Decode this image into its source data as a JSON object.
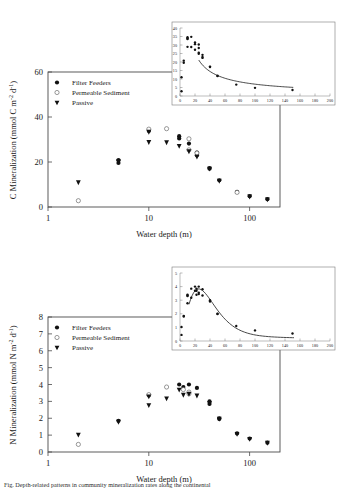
{
  "figure": {
    "caption_partial": "Fig. Depth-related patterns in community mineralization rates along the continental",
    "panels": [
      "top",
      "bottom"
    ]
  },
  "legend": {
    "items": [
      {
        "label": "Filter Feeders",
        "marker": "filled-circle"
      },
      {
        "label": "Permeable Sediment",
        "marker": "open-circle"
      },
      {
        "label": "Passive",
        "marker": "filled-triangle-down"
      }
    ]
  },
  "chart_data": [
    {
      "id": "c-mineralization-main",
      "type": "scatter",
      "title": "",
      "xlabel": "Water depth (m)",
      "ylabel": "C Mineralization (mmol C m-2 d-1)",
      "ylabel_display": "C Mineralization (mmol C m",
      "ylabel_sup1": "-2",
      "ylabel_mid": " d",
      "ylabel_sup2": "-1",
      "ylabel_end": ")",
      "xscale": "log",
      "xlim": [
        1,
        200
      ],
      "ylim": [
        0,
        60
      ],
      "xticks": [
        1,
        10,
        100
      ],
      "xtick_labels": [
        "1",
        "10",
        "100"
      ],
      "yticks": [
        0,
        20,
        40,
        60
      ],
      "ytick_labels": [
        "0",
        "20",
        "40",
        "60"
      ],
      "grid": false,
      "legend_position": "upper-left",
      "series": [
        {
          "name": "Filter Feeders",
          "marker": "filled-circle",
          "points": [
            {
              "x": 5,
              "y": 20.8
            },
            {
              "x": 5,
              "y": 19.6
            },
            {
              "x": 10,
              "y": 33.8
            },
            {
              "x": 20,
              "y": 31.5
            },
            {
              "x": 20,
              "y": 30.5
            },
            {
              "x": 25,
              "y": 28.2
            },
            {
              "x": 30,
              "y": 24.2
            },
            {
              "x": 30,
              "y": 23.0
            },
            {
              "x": 40,
              "y": 17.3
            },
            {
              "x": 40,
              "y": 17.0
            },
            {
              "x": 50,
              "y": 11.9
            },
            {
              "x": 75,
              "y": 6.7
            },
            {
              "x": 100,
              "y": 4.8
            },
            {
              "x": 150,
              "y": 3.5
            }
          ]
        },
        {
          "name": "Permeable Sediment",
          "marker": "open-circle",
          "points": [
            {
              "x": 2,
              "y": 2.8
            },
            {
              "x": 10,
              "y": 34.6
            },
            {
              "x": 15,
              "y": 34.8
            },
            {
              "x": 25,
              "y": 30.3
            },
            {
              "x": 25,
              "y": 25.4
            },
            {
              "x": 30,
              "y": 24.0
            },
            {
              "x": 75,
              "y": 6.5
            }
          ]
        },
        {
          "name": "Passive",
          "marker": "filled-triangle-down",
          "points": [
            {
              "x": 2,
              "y": 11.0
            },
            {
              "x": 5,
              "y": 20.4
            },
            {
              "x": 10,
              "y": 33.5
            },
            {
              "x": 10,
              "y": 28.9
            },
            {
              "x": 15,
              "y": 28.8
            },
            {
              "x": 20,
              "y": 27.2
            },
            {
              "x": 25,
              "y": 24.8
            },
            {
              "x": 30,
              "y": 22.4
            },
            {
              "x": 40,
              "y": 17.1
            },
            {
              "x": 50,
              "y": 11.7
            },
            {
              "x": 100,
              "y": 4.7
            },
            {
              "x": 150,
              "y": 3.4
            }
          ]
        }
      ]
    },
    {
      "id": "c-mineralization-inset",
      "type": "scatter",
      "xlabel": "",
      "ylabel": "",
      "xscale": "linear",
      "xlim": [
        0,
        200
      ],
      "ylim": [
        0,
        40
      ],
      "xticks": [
        0,
        20,
        40,
        60,
        80,
        100,
        120,
        140,
        160,
        180,
        200
      ],
      "xtick_labels": [
        "0",
        "20",
        "40",
        "60",
        "80",
        "100",
        "120",
        "140",
        "160",
        "180",
        "200"
      ],
      "yticks": [
        0,
        5,
        10,
        15,
        20,
        25,
        30,
        35,
        40
      ],
      "ytick_labels": [
        "0",
        "5",
        "10",
        "15",
        "20",
        "25",
        "30",
        "35",
        "40"
      ],
      "grid": false,
      "has_fit_curve": true,
      "fit_curve_note": "decaying power/exponential fit from ~22 at x=25 to ~3 at x=150",
      "series": [
        {
          "name": "All data",
          "marker": "filled-circle",
          "points": [
            {
              "x": 2,
              "y": 11.0
            },
            {
              "x": 2,
              "y": 2.8
            },
            {
              "x": 5,
              "y": 20.8
            },
            {
              "x": 5,
              "y": 19.6
            },
            {
              "x": 10,
              "y": 34.6
            },
            {
              "x": 10,
              "y": 33.8
            },
            {
              "x": 10,
              "y": 33.5
            },
            {
              "x": 10,
              "y": 28.9
            },
            {
              "x": 15,
              "y": 34.8
            },
            {
              "x": 15,
              "y": 28.8
            },
            {
              "x": 20,
              "y": 31.5
            },
            {
              "x": 20,
              "y": 30.5
            },
            {
              "x": 20,
              "y": 27.2
            },
            {
              "x": 25,
              "y": 30.3
            },
            {
              "x": 25,
              "y": 28.2
            },
            {
              "x": 25,
              "y": 25.4
            },
            {
              "x": 25,
              "y": 24.8
            },
            {
              "x": 30,
              "y": 24.2
            },
            {
              "x": 30,
              "y": 23.0
            },
            {
              "x": 30,
              "y": 22.4
            },
            {
              "x": 40,
              "y": 17.3
            },
            {
              "x": 40,
              "y": 17.1
            },
            {
              "x": 50,
              "y": 11.9
            },
            {
              "x": 50,
              "y": 11.7
            },
            {
              "x": 75,
              "y": 6.7
            },
            {
              "x": 100,
              "y": 4.8
            },
            {
              "x": 150,
              "y": 3.5
            }
          ]
        }
      ]
    },
    {
      "id": "n-mineralization-main",
      "type": "scatter",
      "title": "",
      "xlabel": "Water depth (m)",
      "ylabel": "N Mineralization (mmol N m-2 d-1)",
      "ylabel_display": "N Mineralization (mmol N m",
      "ylabel_sup1": "-2",
      "ylabel_mid": " d",
      "ylabel_sup2": "-1",
      "ylabel_end": ")",
      "xscale": "log",
      "xlim": [
        1,
        200
      ],
      "ylim": [
        0,
        8
      ],
      "xticks": [
        1,
        10,
        100
      ],
      "xtick_labels": [
        "1",
        "10",
        "100"
      ],
      "yticks": [
        0,
        1,
        2,
        3,
        4,
        5,
        6,
        7,
        8
      ],
      "ytick_labels": [
        "0",
        "1",
        "2",
        "3",
        "4",
        "5",
        "6",
        "7",
        "8"
      ],
      "grid": false,
      "legend_position": "upper-left",
      "series": [
        {
          "name": "Filter Feeders",
          "marker": "filled-circle",
          "points": [
            {
              "x": 5,
              "y": 1.85
            },
            {
              "x": 10,
              "y": 3.35
            },
            {
              "x": 20,
              "y": 4.0
            },
            {
              "x": 22,
              "y": 3.85
            },
            {
              "x": 25,
              "y": 4.0
            },
            {
              "x": 30,
              "y": 3.8
            },
            {
              "x": 40,
              "y": 3.0
            },
            {
              "x": 40,
              "y": 2.85
            },
            {
              "x": 50,
              "y": 2.0
            },
            {
              "x": 50,
              "y": 1.95
            },
            {
              "x": 75,
              "y": 1.1
            },
            {
              "x": 100,
              "y": 0.8
            },
            {
              "x": 150,
              "y": 0.55
            }
          ]
        },
        {
          "name": "Permeable Sediment",
          "marker": "open-circle",
          "points": [
            {
              "x": 2,
              "y": 0.45
            },
            {
              "x": 10,
              "y": 3.4
            },
            {
              "x": 15,
              "y": 3.85
            },
            {
              "x": 22,
              "y": 3.7
            },
            {
              "x": 25,
              "y": 3.55
            },
            {
              "x": 25,
              "y": 3.45
            }
          ]
        },
        {
          "name": "Passive",
          "marker": "filled-triangle-down",
          "points": [
            {
              "x": 2,
              "y": 1.03
            },
            {
              "x": 5,
              "y": 1.8
            },
            {
              "x": 10,
              "y": 3.3
            },
            {
              "x": 10,
              "y": 2.78
            },
            {
              "x": 15,
              "y": 3.18
            },
            {
              "x": 20,
              "y": 3.7
            },
            {
              "x": 22,
              "y": 3.4
            },
            {
              "x": 25,
              "y": 3.45
            },
            {
              "x": 30,
              "y": 3.35
            },
            {
              "x": 40,
              "y": 2.9
            },
            {
              "x": 50,
              "y": 1.98
            },
            {
              "x": 75,
              "y": 1.08
            },
            {
              "x": 100,
              "y": 0.78
            },
            {
              "x": 150,
              "y": 0.55
            }
          ]
        }
      ]
    },
    {
      "id": "n-mineralization-inset",
      "type": "scatter",
      "xlabel": "",
      "ylabel": "",
      "xscale": "linear",
      "xlim": [
        0,
        200
      ],
      "ylim": [
        0,
        5
      ],
      "xticks": [
        0,
        20,
        40,
        60,
        80,
        100,
        120,
        140,
        160,
        180,
        200
      ],
      "xtick_labels": [
        "0",
        "20",
        "40",
        "60",
        "80",
        "100",
        "120",
        "140",
        "160",
        "180",
        "200"
      ],
      "yticks": [
        0,
        1,
        2,
        3,
        4,
        5
      ],
      "ytick_labels": [
        "0",
        "1",
        "2",
        "3",
        "4",
        "5"
      ],
      "grid": false,
      "has_fit_curve": true,
      "fit_curve_note": "rise then decay fit peaking ~3.4 near x=25 declining to ~0.55 at x=150",
      "series": [
        {
          "name": "All data",
          "marker": "filled-circle",
          "points": [
            {
              "x": 2,
              "y": 1.03
            },
            {
              "x": 2,
              "y": 0.45
            },
            {
              "x": 5,
              "y": 1.85
            },
            {
              "x": 5,
              "y": 1.8
            },
            {
              "x": 10,
              "y": 3.4
            },
            {
              "x": 10,
              "y": 3.35
            },
            {
              "x": 10,
              "y": 3.3
            },
            {
              "x": 10,
              "y": 2.78
            },
            {
              "x": 15,
              "y": 3.85
            },
            {
              "x": 15,
              "y": 3.18
            },
            {
              "x": 20,
              "y": 4.0
            },
            {
              "x": 20,
              "y": 3.7
            },
            {
              "x": 22,
              "y": 3.85
            },
            {
              "x": 22,
              "y": 3.7
            },
            {
              "x": 22,
              "y": 3.4
            },
            {
              "x": 25,
              "y": 4.0
            },
            {
              "x": 25,
              "y": 3.55
            },
            {
              "x": 25,
              "y": 3.45
            },
            {
              "x": 30,
              "y": 3.8
            },
            {
              "x": 30,
              "y": 3.35
            },
            {
              "x": 40,
              "y": 3.0
            },
            {
              "x": 40,
              "y": 2.9
            },
            {
              "x": 50,
              "y": 2.0
            },
            {
              "x": 50,
              "y": 1.98
            },
            {
              "x": 75,
              "y": 1.1
            },
            {
              "x": 100,
              "y": 0.78
            },
            {
              "x": 150,
              "y": 0.55
            }
          ]
        }
      ]
    }
  ]
}
